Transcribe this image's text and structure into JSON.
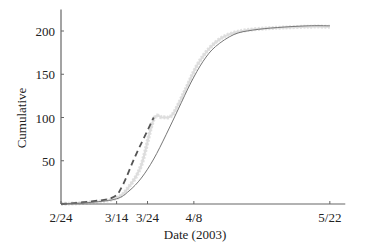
{
  "chart_data": {
    "type": "line",
    "title": "",
    "xlabel": "Date (2003)",
    "ylabel": "Cumulative",
    "x_tick_labels": [
      "2/24",
      "3/14",
      "3/24",
      "4/8",
      "5/22"
    ],
    "x_tick_days": [
      0,
      18,
      28,
      43,
      87
    ],
    "y_ticks": [
      50,
      100,
      150,
      200
    ],
    "xlim_days": [
      0,
      92
    ],
    "ylim": [
      0,
      225
    ],
    "grid": false,
    "legend": null,
    "series": [
      {
        "name": "observed data (scatter band)",
        "style": "light gray noisy band",
        "color": "#c8c8c8",
        "x_days": [
          0,
          10,
          18,
          22,
          26,
          30,
          33,
          36,
          40,
          44,
          48,
          52,
          56,
          60,
          66,
          72,
          80,
          87
        ],
        "values": [
          0,
          2,
          7,
          20,
          45,
          98,
          100,
          103,
          130,
          160,
          180,
          192,
          198,
          201,
          203,
          204,
          205,
          205
        ]
      },
      {
        "name": "model fit (dashed)",
        "style": "dashed",
        "color": "#555555",
        "x_days": [
          0,
          10,
          17,
          20,
          24,
          28,
          30
        ],
        "values": [
          0,
          3,
          8,
          22,
          55,
          85,
          100
        ]
      },
      {
        "name": "model fit (solid)",
        "style": "solid",
        "color": "#777777",
        "x_days": [
          0,
          10,
          18,
          22,
          26,
          30,
          34,
          38,
          42,
          46,
          50,
          56,
          62,
          70,
          80,
          87
        ],
        "values": [
          0,
          2,
          6,
          15,
          30,
          52,
          80,
          110,
          140,
          165,
          182,
          196,
          201,
          204,
          206,
          206
        ]
      }
    ]
  }
}
